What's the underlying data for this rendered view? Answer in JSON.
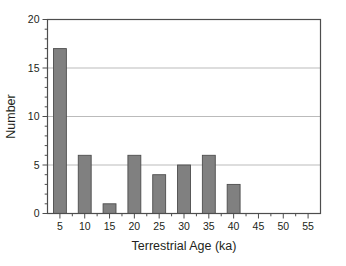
{
  "chart_data": {
    "type": "bar",
    "title": "",
    "subtitle": "",
    "xlabel": "Terrestrial Age (ka)",
    "ylabel": "Number",
    "categories": [
      "5",
      "10",
      "15",
      "20",
      "25",
      "30",
      "35",
      "40",
      "45",
      "50",
      "55"
    ],
    "values": [
      17,
      6,
      1,
      6,
      4,
      5,
      6,
      3,
      0,
      0,
      0
    ],
    "xlim": [
      2.5,
      57.5
    ],
    "ylim": [
      0,
      20
    ],
    "x_tick_labels": [
      "5",
      "10",
      "15",
      "20",
      "25",
      "30",
      "35",
      "40",
      "45",
      "50",
      "55"
    ],
    "y_tick_labels": [
      "0",
      "5",
      "10",
      "15",
      "20"
    ],
    "y_major_ticks": [
      0,
      5,
      10,
      15,
      20
    ],
    "y_minor_ticks": [
      1,
      2,
      3,
      4,
      6,
      7,
      8,
      9,
      11,
      12,
      13,
      14,
      16,
      17,
      18,
      19
    ],
    "x_major_ticks": [
      5,
      10,
      15,
      20,
      25,
      30,
      35,
      40,
      45,
      50,
      55
    ],
    "x_minor_ticks": [
      7.5,
      12.5,
      17.5,
      22.5,
      27.5,
      32.5,
      37.5,
      42.5,
      47.5,
      52.5
    ],
    "grid": "horizontal",
    "gridlines_at": [
      5,
      10,
      15
    ],
    "legend": null,
    "legend_position": "none",
    "bar_color": "#808080",
    "bar_edge_color": "#4d4d4d",
    "grid_color": "#b3b3b3",
    "axis_color": "#4d4d4d",
    "background_color": "#ffffff",
    "bar_width_units": 2.6
  }
}
